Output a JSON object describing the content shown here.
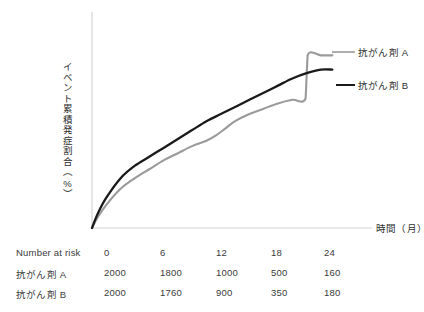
{
  "chart_data": {
    "type": "line",
    "title": "",
    "xlabel": "時間（月）",
    "ylabel": "イベント累積発症割合（%）",
    "xlim": [
      0,
      26
    ],
    "ylim": [
      0,
      100
    ],
    "grid": false,
    "legend_position": "right",
    "xticks": [
      0,
      6,
      12,
      18,
      24
    ],
    "series": [
      {
        "name": "抗がん剤 A",
        "color": "#9a9a9a",
        "x": [
          0,
          0.6,
          1.5,
          3,
          4.5,
          6,
          7.5,
          9,
          10.5,
          12,
          13,
          14,
          15,
          16.5,
          18,
          19.5,
          21,
          22.4,
          22.6,
          24,
          25.2
        ],
        "y": [
          0,
          6,
          13,
          22,
          28,
          33,
          38,
          42,
          46,
          49,
          52,
          56,
          60,
          64,
          67,
          70,
          72,
          73,
          97,
          97,
          97
        ]
      },
      {
        "name": "抗がん剤 B",
        "color": "#1a1a1a",
        "x": [
          0,
          0.6,
          1.5,
          3,
          4.5,
          6,
          7.5,
          9,
          10.5,
          12,
          13.5,
          15,
          16.5,
          18,
          19.5,
          21,
          22.5,
          24,
          25.2
        ],
        "y": [
          0,
          8,
          17,
          28,
          35,
          40,
          45,
          50,
          55,
          60,
          64,
          68,
          72,
          76,
          80,
          84,
          87,
          89,
          89
        ]
      }
    ]
  },
  "legend": {
    "series_a_label": "抗がん剤 A",
    "series_b_label": "抗がん剤 B"
  },
  "axes": {
    "x_title": "時間（月）",
    "y_title": "イベント累積発症割合（%）"
  },
  "risk_table": {
    "header_label": "Number at risk",
    "header_values": [
      "0",
      "6",
      "12",
      "18",
      "24"
    ],
    "rows": [
      {
        "label": "抗がん剤 A",
        "values": [
          "2000",
          "1800",
          "1000",
          "500",
          "160"
        ]
      },
      {
        "label": "抗がん剤 B",
        "values": [
          "2000",
          "1760",
          "900",
          "350",
          "180"
        ]
      }
    ]
  },
  "colors": {
    "series_a": "#9a9a9a",
    "series_b": "#1a1a1a",
    "axis": "#d0d0d0",
    "text": "#3a3a3a",
    "background": "#ffffff"
  }
}
